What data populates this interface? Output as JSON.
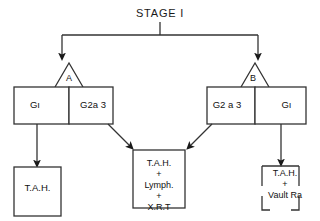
{
  "diagram": {
    "title": "STAGE I",
    "branches": [
      {
        "letter": "A",
        "side": "left"
      },
      {
        "letter": "B",
        "side": "right"
      }
    ],
    "grade_nodes": [
      {
        "label": "Gı",
        "position": "left-outer"
      },
      {
        "label": "G2a 3",
        "position": "left-inner"
      },
      {
        "label": "G2 a 3",
        "position": "right-inner"
      },
      {
        "label": "Gı",
        "position": "right-outer"
      }
    ],
    "outcome_nodes": [
      {
        "label": "T.A.H.",
        "position": "bottom-left"
      },
      {
        "label": "T.A.H.\n+\nLymph.\n+\nX.R.T",
        "position": "bottom-center"
      },
      {
        "label": "T.A.H.\n+\nVault Ra",
        "position": "bottom-right"
      }
    ],
    "colors": {
      "ink": "#111111",
      "stroke": "#222222",
      "background": "#ffffff"
    }
  }
}
